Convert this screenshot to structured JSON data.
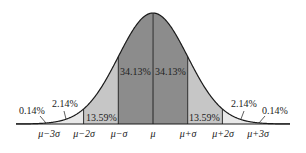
{
  "chart_data": {
    "type": "area",
    "title": "",
    "xlabel": "",
    "ylabel": "",
    "categories": [
      "μ−3σ",
      "μ−2σ",
      "μ−σ",
      "μ",
      "μ+σ",
      "μ+2σ",
      "μ+3σ"
    ],
    "regions": [
      {
        "from": "-∞",
        "to": "μ−3σ",
        "label": "0.14%",
        "value": 0.14
      },
      {
        "from": "μ−3σ",
        "to": "μ−2σ",
        "label": "2.14%",
        "value": 2.14
      },
      {
        "from": "μ−2σ",
        "to": "μ−σ",
        "label": "13.59%",
        "value": 13.59
      },
      {
        "from": "μ−σ",
        "to": "μ",
        "label": "34.13%",
        "value": 34.13
      },
      {
        "from": "μ",
        "to": "μ+σ",
        "label": "34.13%",
        "value": 34.13
      },
      {
        "from": "μ+σ",
        "to": "μ+2σ",
        "label": "13.59%",
        "value": 13.59
      },
      {
        "from": "μ+2σ",
        "to": "μ+3σ",
        "label": "2.14%",
        "value": 2.14
      },
      {
        "from": "μ+3σ",
        "to": "+∞",
        "label": "0.14%",
        "value": 0.14
      }
    ],
    "colors": {
      "inner": "#8c8c8c",
      "middle": "#c6c6c6",
      "outer": "#e8e8e8",
      "line": "#1a1a1a"
    },
    "grid": false,
    "legend": "none"
  },
  "labels": {
    "left_tail": "0.14%",
    "left_outer": "2.14%",
    "left_middle": "13.59%",
    "left_inner": "34.13%",
    "right_inner": "34.13%",
    "right_middle": "13.59%",
    "right_outer": "2.14%",
    "right_tail": "0.14%"
  },
  "axis": {
    "m3": "μ−3σ",
    "m2": "μ−2σ",
    "m1": "μ−σ",
    "mu": "μ",
    "p1": "μ+σ",
    "p2": "μ+2σ",
    "p3": "μ+3σ"
  }
}
